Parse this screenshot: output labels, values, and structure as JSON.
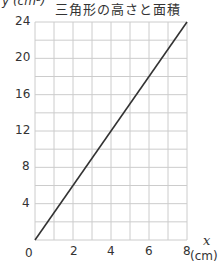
{
  "chart_data": {
    "type": "line",
    "title": "三角形の高さと面積",
    "xlabel": "x",
    "xunit": "(cm)",
    "ylabel": "y (cm²)",
    "x": [
      0,
      8
    ],
    "series": [
      {
        "name": "面積",
        "values": [
          0,
          24
        ]
      }
    ],
    "xlim": [
      0,
      8
    ],
    "ylim": [
      0,
      24
    ],
    "xticks": [
      0,
      2,
      4,
      6,
      8
    ],
    "yticks": [
      4,
      8,
      12,
      16,
      20,
      24
    ],
    "grid": true,
    "grid_x_step": 1,
    "grid_y_step": 2,
    "line_color": "#333333",
    "grid_color": "#cccccc"
  },
  "labels": {
    "title": "三角形の高さと面積",
    "ylabel": "y (cm²)",
    "xvar": "x",
    "xunit": "(cm)",
    "origin": "0",
    "xticks": [
      "2",
      "4",
      "6",
      "8"
    ],
    "yticks": [
      "24",
      "20",
      "16",
      "12",
      "8",
      "4"
    ]
  }
}
